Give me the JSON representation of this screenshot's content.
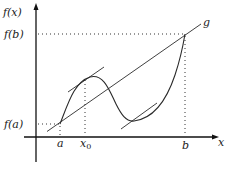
{
  "figure": {
    "labels": {
      "y_axis": "f(x)",
      "x_axis": "x",
      "f_b": "f(b)",
      "f_a": "f(a)",
      "a": "a",
      "x0_base": "x",
      "x0_sub": "0",
      "b": "b",
      "secant": "g"
    },
    "colors": {
      "ink": "#1a1a1a",
      "background": "#ffffff"
    },
    "geometry": {
      "origin_px": [
        36,
        137
      ],
      "point_a_px": [
        60,
        124
      ],
      "point_b_px": [
        185,
        34
      ],
      "x0_px": 85,
      "local_max_px": [
        90,
        77
      ],
      "local_min_px": [
        132,
        121
      ]
    }
  }
}
